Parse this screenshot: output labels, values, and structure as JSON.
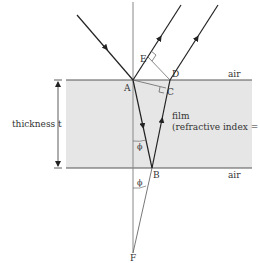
{
  "diagram": {
    "colors": {
      "film_fill": "#e6e6e6",
      "ray": "#222222",
      "normal": "#888888",
      "construction": "#555555",
      "text": "#333333"
    },
    "labels": {
      "point_a": "A",
      "point_b": "B",
      "point_c": "C",
      "point_d": "D",
      "point_e": "E",
      "point_f": "F",
      "air_top": "air",
      "air_bottom": "air",
      "thickness": "thickness t",
      "film_line1": "film",
      "film_line2": "(refractive index = n)",
      "angle_phi_1": "ϕ",
      "angle_phi_2": "ϕ"
    }
  }
}
